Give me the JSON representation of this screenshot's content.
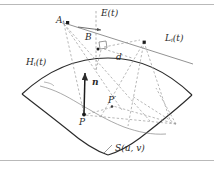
{
  "figure": {
    "background_color": "#ffffff",
    "stroke_color": "#2b2b2b",
    "dashed_color": "#9a9a9a",
    "thin_color": "#7d7d7d",
    "rule_color": "#b9b9b9",
    "width": 214,
    "height": 169
  },
  "labels": {
    "point_a": "A",
    "point_a_sub": "i",
    "point_b": "B",
    "line_e": "E",
    "line_e_arg": "(t)",
    "line_l": "L",
    "line_l_sub": "i",
    "line_l_arg": "(t)",
    "curve_h": "H",
    "curve_h_sub": "i",
    "curve_h_arg": "(t)",
    "distance_d": "d",
    "normal_n": "n",
    "point_p": "P",
    "point_p_prime": "P′",
    "surface_s": "S",
    "surface_s_arg": "(u, v)"
  },
  "geometry": {
    "point_A": [
      62,
      22
    ],
    "point_B_arrow_tip": [
      103,
      29
    ],
    "point_B_label": [
      88,
      38
    ],
    "right_angle_box": [
      101,
      47
    ],
    "point_on_L": [
      144,
      42
    ],
    "vanishing_point": [
      176,
      124
    ],
    "point_P": [
      84,
      115
    ],
    "point_P_prime": [
      113,
      106
    ],
    "normal_tip": [
      85,
      72
    ],
    "E_line_x": 96,
    "E_line_y_top": 12,
    "E_line_y_bottom": 68,
    "L_line_start": [
      96,
      29
    ],
    "L_line_end": [
      193,
      62
    ]
  },
  "elements": [
    {
      "name": "surface-patch",
      "kind": "curved-quad",
      "role": "parametric surface S(u,v)"
    },
    {
      "name": "normal-vector",
      "kind": "arrow",
      "role": "unit normal n at P"
    },
    {
      "name": "iso-curve",
      "kind": "thin-curve",
      "role": "curve H_i(t) on surface"
    },
    {
      "name": "epipolar-line",
      "kind": "solid-line",
      "role": "line L_i(t)"
    },
    {
      "name": "vertical-dashed-line",
      "kind": "dashed-line",
      "role": "line E(t)"
    },
    {
      "name": "projection-rays",
      "kind": "dashed-lines",
      "role": "rays from A_i and vanishing point"
    }
  ]
}
